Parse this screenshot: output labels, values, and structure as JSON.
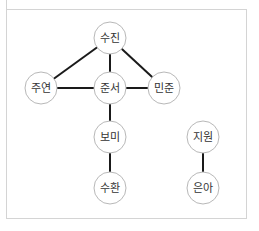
{
  "diagram": {
    "type": "undirected-graph",
    "colors": {
      "edge": "#1a1a1a",
      "node_stroke": "#b8b8b8",
      "node_fill": "#ffffff",
      "label": "#333333",
      "frame": "#d4d4d4"
    },
    "node_radius": 16,
    "nodes": [
      {
        "id": "sujin",
        "label": "수진",
        "x": 110,
        "y": 38
      },
      {
        "id": "juyeon",
        "label": "주연",
        "x": 41,
        "y": 88
      },
      {
        "id": "junseo",
        "label": "준서",
        "x": 110,
        "y": 88
      },
      {
        "id": "minjun",
        "label": "민준",
        "x": 164,
        "y": 88
      },
      {
        "id": "bomi",
        "label": "보미",
        "x": 110,
        "y": 137
      },
      {
        "id": "suhwan",
        "label": "수환",
        "x": 110,
        "y": 188
      },
      {
        "id": "jiwon",
        "label": "지원",
        "x": 203,
        "y": 137
      },
      {
        "id": "euna",
        "label": "은아",
        "x": 203,
        "y": 188
      }
    ],
    "edges": [
      {
        "from": "sujin",
        "to": "juyeon"
      },
      {
        "from": "sujin",
        "to": "junseo"
      },
      {
        "from": "sujin",
        "to": "minjun"
      },
      {
        "from": "juyeon",
        "to": "junseo"
      },
      {
        "from": "junseo",
        "to": "minjun"
      },
      {
        "from": "junseo",
        "to": "bomi"
      },
      {
        "from": "bomi",
        "to": "suhwan"
      },
      {
        "from": "jiwon",
        "to": "euna"
      }
    ]
  }
}
